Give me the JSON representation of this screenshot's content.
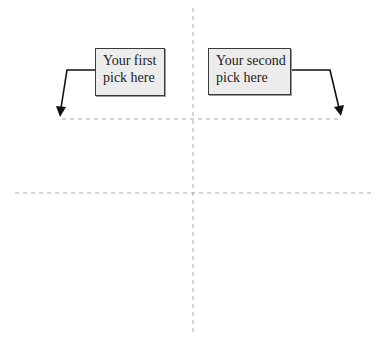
{
  "diagram": {
    "type": "quadrant-grid",
    "colors": {
      "grid_line": "#aaaaaa",
      "box_fill": "#ececec",
      "box_border": "#3a3a3a",
      "arrow": "#111111",
      "text": "#222222"
    },
    "callouts": [
      {
        "id": "first",
        "lines": [
          "Your first",
          "pick here"
        ]
      },
      {
        "id": "second",
        "lines": [
          "Your second",
          "pick here"
        ]
      }
    ]
  }
}
